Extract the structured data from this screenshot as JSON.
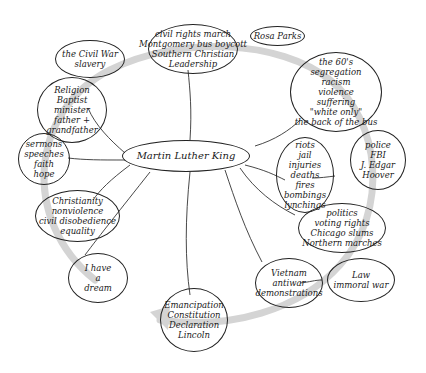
{
  "colors": {
    "ink": "#1a1a1a",
    "arrow": "#d4d4d4",
    "background": "#ffffff"
  },
  "center": {
    "label": "Martin Luther King"
  },
  "nodes": [
    {
      "id": "civil-war",
      "lines": [
        "the Civil War",
        "slavery"
      ]
    },
    {
      "id": "civil-rights",
      "lines": [
        "civil rights march",
        "Montgomery bus boycott",
        "Southern Christian",
        "Leadership"
      ]
    },
    {
      "id": "rosa-parks",
      "lines": [
        "Rosa Parks"
      ]
    },
    {
      "id": "religion",
      "lines": [
        "Religion",
        "Baptist",
        "minister",
        "father +",
        "grandfather"
      ]
    },
    {
      "id": "sixties",
      "lines": [
        "the 60's",
        "segregation",
        "racism",
        "violence",
        "suffering",
        "\"white only\"",
        "the back of the bus"
      ]
    },
    {
      "id": "sermons",
      "lines": [
        "sermons",
        "speeches",
        "faith",
        "hope"
      ]
    },
    {
      "id": "riots",
      "lines": [
        "riots",
        "jail",
        "injuries",
        "deaths",
        "fires",
        "bombings",
        "lynchings"
      ]
    },
    {
      "id": "police",
      "lines": [
        "police",
        "FBI",
        "J. Edgar",
        "Hoover"
      ]
    },
    {
      "id": "christianity",
      "lines": [
        "Christianity",
        "nonviolence",
        "civil disobedience",
        "equality"
      ]
    },
    {
      "id": "politics",
      "lines": [
        "politics",
        "voting rights",
        "Chicago slums",
        "Northern marches"
      ]
    },
    {
      "id": "dream",
      "lines": [
        "I have",
        "a",
        "dream"
      ]
    },
    {
      "id": "vietnam",
      "lines": [
        "Vietnam",
        "antiwar",
        "demonstrations"
      ]
    },
    {
      "id": "law",
      "lines": [
        "Law",
        "immoral war"
      ]
    },
    {
      "id": "emancipation",
      "lines": [
        "Emancipation",
        "Constitution",
        "Declaration",
        "Lincoln"
      ]
    }
  ]
}
